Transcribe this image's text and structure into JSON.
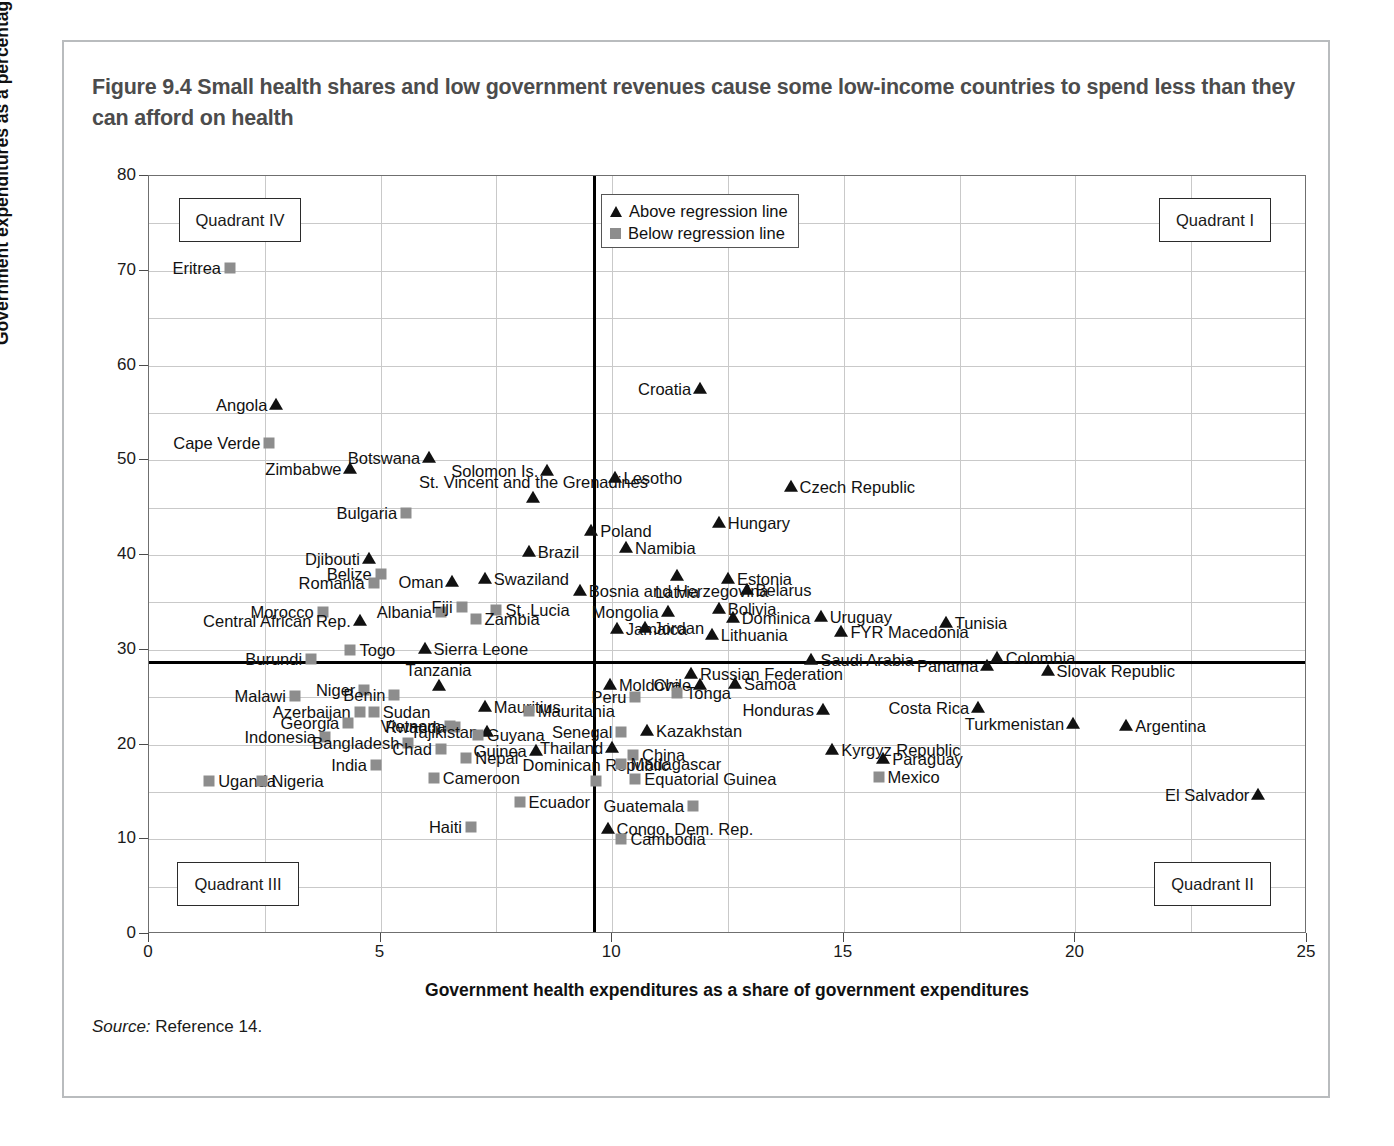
{
  "figure": {
    "title": "Figure 9.4  Small health shares and low government revenues cause some low-income countries to spend less than they can afford on health",
    "source_prefix": "Source:",
    "source_text": "Reference 14."
  },
  "legend": {
    "position": "top-center-right",
    "entries": [
      {
        "label": "Above regression line",
        "marker": "triangle",
        "color": "#111111"
      },
      {
        "label": "Below regression line",
        "marker": "square",
        "color": "#8d8d8d"
      }
    ]
  },
  "quadrants": [
    {
      "name": "Quadrant IV",
      "corner": "top-left"
    },
    {
      "name": "Quadrant I",
      "corner": "top-right"
    },
    {
      "name": "Quadrant III",
      "corner": "bottom-left"
    },
    {
      "name": "Quadrant II",
      "corner": "bottom-right"
    }
  ],
  "chart_data": {
    "type": "scatter",
    "title": "Figure 9.4  Small health shares and low government revenues cause some low-income countries to spend less than they can afford on health",
    "xlabel": "Government health expenditures as a share of government expenditures",
    "ylabel": "Government expenditures as a percentage of GDP",
    "xlim": [
      0,
      25
    ],
    "ylim": [
      0,
      80
    ],
    "xticks": [
      0,
      5,
      10,
      15,
      20,
      25
    ],
    "yticks": [
      0,
      10,
      20,
      30,
      40,
      50,
      60,
      70,
      80
    ],
    "grid": true,
    "reference_lines": {
      "vertical_x": 9.6,
      "horizontal_y": 28.7
    },
    "series": [
      {
        "name": "Above regression line",
        "marker": "triangle",
        "color": "#111111"
      },
      {
        "name": "Below regression line",
        "marker": "square",
        "color": "#8d8d8d"
      }
    ],
    "points": [
      {
        "label": "Eritrea",
        "x": 1.75,
        "y": 70.3,
        "group": "below",
        "lp": "left"
      },
      {
        "label": "Angola",
        "x": 2.75,
        "y": 55.8,
        "group": "above",
        "lp": "left"
      },
      {
        "label": "Cape Verde",
        "x": 2.6,
        "y": 51.8,
        "group": "below",
        "lp": "left"
      },
      {
        "label": "Botswana",
        "x": 6.05,
        "y": 50.2,
        "group": "above",
        "lp": "left"
      },
      {
        "label": "Zimbabwe",
        "x": 4.35,
        "y": 49.1,
        "group": "above",
        "lp": "left"
      },
      {
        "label": "Solomon Is.",
        "x": 8.6,
        "y": 48.9,
        "group": "above",
        "lp": "left"
      },
      {
        "label": "Lesotho",
        "x": 10.05,
        "y": 48.1,
        "group": "above",
        "lp": "right"
      },
      {
        "label": "St. Vincent and the Grenadines",
        "x": 8.3,
        "y": 46.0,
        "group": "above",
        "lp": "above"
      },
      {
        "label": "Czech Republic",
        "x": 13.85,
        "y": 47.2,
        "group": "above",
        "lp": "right"
      },
      {
        "label": "Croatia",
        "x": 11.9,
        "y": 57.5,
        "group": "above",
        "lp": "left"
      },
      {
        "label": "Bulgaria",
        "x": 5.55,
        "y": 44.4,
        "group": "below",
        "lp": "left"
      },
      {
        "label": "Hungary",
        "x": 12.3,
        "y": 43.4,
        "group": "above",
        "lp": "right"
      },
      {
        "label": "Poland",
        "x": 9.55,
        "y": 42.5,
        "group": "above",
        "lp": "right"
      },
      {
        "label": "Namibia",
        "x": 10.3,
        "y": 40.7,
        "group": "above",
        "lp": "right"
      },
      {
        "label": "Brazil",
        "x": 8.2,
        "y": 40.3,
        "group": "above",
        "lp": "right"
      },
      {
        "label": "Djibouti",
        "x": 4.75,
        "y": 39.6,
        "group": "above",
        "lp": "left"
      },
      {
        "label": "Belize",
        "x": 5.0,
        "y": 38.0,
        "group": "below",
        "lp": "left"
      },
      {
        "label": "Romania",
        "x": 4.85,
        "y": 37.0,
        "group": "below",
        "lp": "left"
      },
      {
        "label": "Oman",
        "x": 6.55,
        "y": 37.1,
        "group": "above",
        "lp": "left"
      },
      {
        "label": "Swaziland",
        "x": 7.25,
        "y": 37.5,
        "group": "above",
        "lp": "right"
      },
      {
        "label": "Bosnia and Herzegovina",
        "x": 9.3,
        "y": 36.2,
        "group": "above",
        "lp": "right"
      },
      {
        "label": "Estonia",
        "x": 12.5,
        "y": 37.5,
        "group": "above",
        "lp": "right"
      },
      {
        "label": "Belarus",
        "x": 12.9,
        "y": 36.3,
        "group": "above",
        "lp": "right"
      },
      {
        "label": "Latvia",
        "x": 11.4,
        "y": 37.8,
        "group": "above",
        "lp": "below"
      },
      {
        "label": "Morocco",
        "x": 3.75,
        "y": 34.0,
        "group": "below",
        "lp": "left"
      },
      {
        "label": "Central African Rep.",
        "x": 4.55,
        "y": 33.0,
        "group": "above",
        "lp": "left"
      },
      {
        "label": "Albania",
        "x": 6.3,
        "y": 34.0,
        "group": "below",
        "lp": "left"
      },
      {
        "label": "Fiji",
        "x": 6.75,
        "y": 34.5,
        "group": "below",
        "lp": "left"
      },
      {
        "label": "St. Lucia",
        "x": 7.5,
        "y": 34.2,
        "group": "below",
        "lp": "right"
      },
      {
        "label": "Zambia",
        "x": 7.05,
        "y": 33.2,
        "group": "below",
        "lp": "right"
      },
      {
        "label": "Mongolia",
        "x": 11.2,
        "y": 34.0,
        "group": "above",
        "lp": "left"
      },
      {
        "label": "Bolivia",
        "x": 12.3,
        "y": 34.3,
        "group": "above",
        "lp": "right"
      },
      {
        "label": "Dominica",
        "x": 12.6,
        "y": 33.4,
        "group": "above",
        "lp": "right"
      },
      {
        "label": "Uruguay",
        "x": 14.5,
        "y": 33.5,
        "group": "above",
        "lp": "right"
      },
      {
        "label": "Tunisia",
        "x": 17.2,
        "y": 32.8,
        "group": "above",
        "lp": "right"
      },
      {
        "label": "FYR Macedonia",
        "x": 14.95,
        "y": 31.9,
        "group": "above",
        "lp": "right"
      },
      {
        "label": "Jamaica",
        "x": 10.1,
        "y": 32.2,
        "group": "above",
        "lp": "right"
      },
      {
        "label": "Jordan",
        "x": 10.7,
        "y": 32.3,
        "group": "above",
        "lp": "right"
      },
      {
        "label": "Lithuania",
        "x": 12.15,
        "y": 31.6,
        "group": "above",
        "lp": "right"
      },
      {
        "label": "Togo",
        "x": 4.35,
        "y": 30.0,
        "group": "below",
        "lp": "right"
      },
      {
        "label": "Burundi",
        "x": 3.5,
        "y": 29.0,
        "group": "below",
        "lp": "left"
      },
      {
        "label": "Sierra Leone",
        "x": 5.95,
        "y": 30.1,
        "group": "above",
        "lp": "right"
      },
      {
        "label": "Saudi Arabia",
        "x": 14.3,
        "y": 28.9,
        "group": "above",
        "lp": "right"
      },
      {
        "label": "Colombia",
        "x": 18.3,
        "y": 29.1,
        "group": "above",
        "lp": "right"
      },
      {
        "label": "Panama",
        "x": 18.1,
        "y": 28.3,
        "group": "above",
        "lp": "left"
      },
      {
        "label": "Slovak Republic",
        "x": 19.4,
        "y": 27.8,
        "group": "above",
        "lp": "right"
      },
      {
        "label": "Russian Federation",
        "x": 11.7,
        "y": 27.4,
        "group": "above",
        "lp": "right"
      },
      {
        "label": "Moldova",
        "x": 9.95,
        "y": 26.3,
        "group": "above",
        "lp": "right"
      },
      {
        "label": "Chile",
        "x": 11.9,
        "y": 26.3,
        "group": "above",
        "lp": "left"
      },
      {
        "label": "Samoa",
        "x": 12.65,
        "y": 26.4,
        "group": "above",
        "lp": "right"
      },
      {
        "label": "Tonga",
        "x": 11.4,
        "y": 25.4,
        "group": "below",
        "lp": "right"
      },
      {
        "label": "Peru",
        "x": 10.5,
        "y": 25.0,
        "group": "below",
        "lp": "left"
      },
      {
        "label": "Niger",
        "x": 4.65,
        "y": 25.8,
        "group": "below",
        "lp": "left"
      },
      {
        "label": "Benin",
        "x": 5.3,
        "y": 25.2,
        "group": "below",
        "lp": "left"
      },
      {
        "label": "Malawi",
        "x": 3.15,
        "y": 25.1,
        "group": "below",
        "lp": "left"
      },
      {
        "label": "Tanzania",
        "x": 6.25,
        "y": 26.2,
        "group": "above",
        "lp": "above"
      },
      {
        "label": "Mauritius",
        "x": 7.25,
        "y": 24.0,
        "group": "above",
        "lp": "right"
      },
      {
        "label": "Mauritania",
        "x": 8.2,
        "y": 23.5,
        "group": "below",
        "lp": "right"
      },
      {
        "label": "Azerbaijan",
        "x": 4.55,
        "y": 23.4,
        "group": "below",
        "lp": "left"
      },
      {
        "label": "Sudan",
        "x": 4.85,
        "y": 23.4,
        "group": "below",
        "lp": "right"
      },
      {
        "label": "Georgia",
        "x": 4.3,
        "y": 22.3,
        "group": "below",
        "lp": "left"
      },
      {
        "label": "Vietnam",
        "x": 6.5,
        "y": 22.0,
        "group": "below",
        "lp": "left"
      },
      {
        "label": "Rwanda",
        "x": 6.6,
        "y": 21.8,
        "group": "below",
        "lp": "left"
      },
      {
        "label": "Tajikistan",
        "x": 7.3,
        "y": 21.3,
        "group": "above",
        "lp": "left"
      },
      {
        "label": "Indonesia",
        "x": 3.8,
        "y": 20.8,
        "group": "below",
        "lp": "left"
      },
      {
        "label": "Bangladesh",
        "x": 5.6,
        "y": 20.2,
        "group": "below",
        "lp": "left"
      },
      {
        "label": "Guyana",
        "x": 7.1,
        "y": 21.0,
        "group": "below",
        "lp": "right"
      },
      {
        "label": "Chad",
        "x": 6.3,
        "y": 19.5,
        "group": "below",
        "lp": "left"
      },
      {
        "label": "Nepal",
        "x": 6.85,
        "y": 18.6,
        "group": "below",
        "lp": "right"
      },
      {
        "label": "Guinea",
        "x": 8.35,
        "y": 19.3,
        "group": "above",
        "lp": "left"
      },
      {
        "label": "India",
        "x": 4.9,
        "y": 17.8,
        "group": "below",
        "lp": "left"
      },
      {
        "label": "Uganda",
        "x": 1.3,
        "y": 16.2,
        "group": "below",
        "lp": "right"
      },
      {
        "label": "Nigeria",
        "x": 2.45,
        "y": 16.1,
        "group": "below",
        "lp": "right"
      },
      {
        "label": "Cameroon",
        "x": 6.15,
        "y": 16.5,
        "group": "below",
        "lp": "right"
      },
      {
        "label": "Haiti",
        "x": 6.95,
        "y": 11.3,
        "group": "below",
        "lp": "left"
      },
      {
        "label": "Ecuador",
        "x": 8.0,
        "y": 13.9,
        "group": "below",
        "lp": "right"
      },
      {
        "label": "Dominican Republic",
        "x": 9.65,
        "y": 16.2,
        "group": "below",
        "lp": "above"
      },
      {
        "label": "Thailand",
        "x": 10.0,
        "y": 19.6,
        "group": "above",
        "lp": "left"
      },
      {
        "label": "Senegal",
        "x": 10.2,
        "y": 21.3,
        "group": "below",
        "lp": "left"
      },
      {
        "label": "Kazakhstan",
        "x": 10.75,
        "y": 21.4,
        "group": "above",
        "lp": "right"
      },
      {
        "label": "China",
        "x": 10.45,
        "y": 18.9,
        "group": "below",
        "lp": "right"
      },
      {
        "label": "Madagascar",
        "x": 10.2,
        "y": 17.9,
        "group": "below",
        "lp": "right"
      },
      {
        "label": "Equatorial Guinea",
        "x": 10.5,
        "y": 16.4,
        "group": "below",
        "lp": "right"
      },
      {
        "label": "Guatemala",
        "x": 11.75,
        "y": 13.5,
        "group": "below",
        "lp": "left"
      },
      {
        "label": "Congo, Dem. Rep.",
        "x": 9.9,
        "y": 11.1,
        "group": "above",
        "lp": "right"
      },
      {
        "label": "Cambodia",
        "x": 10.2,
        "y": 10.0,
        "group": "below",
        "lp": "right"
      },
      {
        "label": "Honduras",
        "x": 14.55,
        "y": 23.6,
        "group": "above",
        "lp": "left"
      },
      {
        "label": "Costa Rica",
        "x": 17.9,
        "y": 23.8,
        "group": "above",
        "lp": "left"
      },
      {
        "label": "Turkmenistan",
        "x": 19.95,
        "y": 22.2,
        "group": "above",
        "lp": "left"
      },
      {
        "label": "Argentina",
        "x": 21.1,
        "y": 22.0,
        "group": "above",
        "lp": "right"
      },
      {
        "label": "Kyrgyz Republic",
        "x": 14.75,
        "y": 19.4,
        "group": "above",
        "lp": "right"
      },
      {
        "label": "Paraguay",
        "x": 15.85,
        "y": 18.5,
        "group": "above",
        "lp": "right"
      },
      {
        "label": "Mexico",
        "x": 15.75,
        "y": 16.6,
        "group": "below",
        "lp": "right"
      },
      {
        "label": "El Salvador",
        "x": 23.95,
        "y": 14.7,
        "group": "above",
        "lp": "left"
      }
    ]
  }
}
